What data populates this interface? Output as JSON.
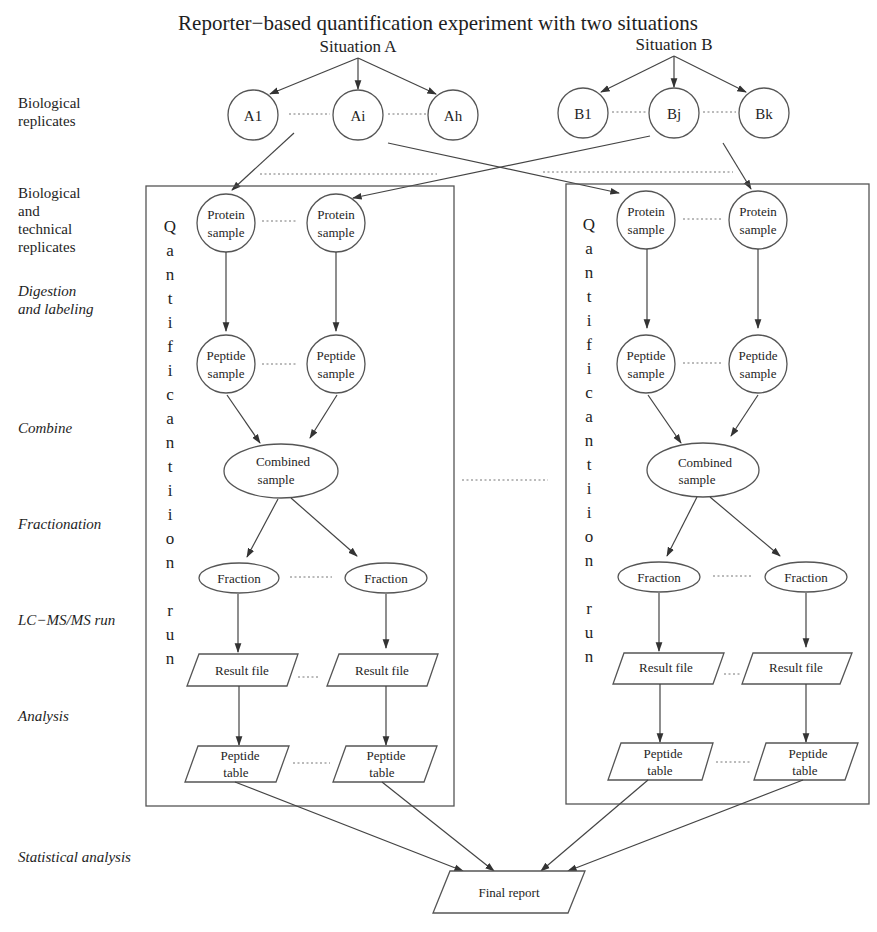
{
  "title": "Reporter−based quantification experiment with two situations",
  "situations": {
    "a": {
      "label": "Situation A",
      "replicates": [
        "A1",
        "Ai",
        "Ah"
      ]
    },
    "b": {
      "label": "Situation B",
      "replicates": [
        "B1",
        "Bj",
        "Bk"
      ]
    }
  },
  "stage_labels": {
    "bio_replicates": [
      "Biological",
      "replicates"
    ],
    "bio_tech_replicates": [
      "Biological",
      "and",
      "technical",
      "replicates"
    ],
    "digestion": [
      "Digestion",
      "and labeling"
    ],
    "combine": "Combine",
    "fractionation": "Fractionation",
    "lcms": "LC−MS/MS run",
    "analysis": "Analysis",
    "statistical": "Statistical analysis"
  },
  "run_box": {
    "vertical_label_letters": [
      "Q",
      "a",
      "n",
      "t",
      "i",
      "f",
      "i",
      "c",
      "a",
      "n",
      "t",
      "i",
      "i",
      "o",
      "n",
      "r",
      "u",
      "n"
    ],
    "protein_sample": [
      "Protein",
      "sample"
    ],
    "peptide_sample": [
      "Peptide",
      "sample"
    ],
    "combined_sample": [
      "Combined",
      "sample"
    ],
    "fraction": "Fraction",
    "result_file": "Result file",
    "peptide_table": [
      "Peptide",
      "table"
    ]
  },
  "final_report": "Final report",
  "colors": {
    "stroke": "#555555",
    "text": "#1e1e1e",
    "background": "#ffffff"
  }
}
